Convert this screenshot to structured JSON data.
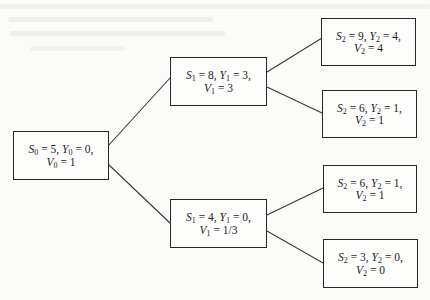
{
  "diagram": {
    "type": "binomial-tree",
    "colors": {
      "border": "#262626",
      "edge": "#3a3a3a",
      "text": "#1c1c1c",
      "background": "#fbfbfa"
    },
    "nodes": [
      {
        "id": "root",
        "level": 0,
        "S": "5",
        "Y": "0",
        "V": "1",
        "line1": {
          "s_sub": "0",
          "s_val": "5",
          "y_sub": "0",
          "y_val": "0"
        },
        "line2": {
          "v_sub": "0",
          "v_val": "1"
        }
      },
      {
        "id": "up",
        "level": 1,
        "S": "8",
        "Y": "3",
        "V": "3",
        "line1": {
          "s_sub": "1",
          "s_val": "8",
          "y_sub": "1",
          "y_val": "3"
        },
        "line2": {
          "v_sub": "1",
          "v_val": "3"
        }
      },
      {
        "id": "down",
        "level": 1,
        "S": "4",
        "Y": "0",
        "V": "1/3",
        "line1": {
          "s_sub": "1",
          "s_val": "4",
          "y_sub": "1",
          "y_val": "0"
        },
        "line2": {
          "v_sub": "1",
          "v_val": "1/3"
        }
      },
      {
        "id": "upup",
        "level": 2,
        "S": "9",
        "Y": "4",
        "V": "4",
        "line1": {
          "s_sub": "2",
          "s_val": "9",
          "y_sub": "2",
          "y_val": "4"
        },
        "line2": {
          "v_sub": "2",
          "v_val": "4"
        }
      },
      {
        "id": "updown",
        "level": 2,
        "S": "6",
        "Y": "1",
        "V": "1",
        "line1": {
          "s_sub": "2",
          "s_val": "6",
          "y_sub": "2",
          "y_val": "1"
        },
        "line2": {
          "v_sub": "2",
          "v_val": "1"
        }
      },
      {
        "id": "downup",
        "level": 2,
        "S": "6",
        "Y": "1",
        "V": "1",
        "line1": {
          "s_sub": "2",
          "s_val": "6",
          "y_sub": "2",
          "y_val": "1"
        },
        "line2": {
          "v_sub": "2",
          "v_val": "1"
        }
      },
      {
        "id": "downdown",
        "level": 2,
        "S": "3",
        "Y": "0",
        "V": "0",
        "line1": {
          "s_sub": "2",
          "s_val": "3",
          "y_sub": "2",
          "y_val": "0"
        },
        "line2": {
          "v_sub": "2",
          "v_val": "0"
        }
      }
    ],
    "edges": [
      [
        "root",
        "up"
      ],
      [
        "root",
        "down"
      ],
      [
        "up",
        "upup"
      ],
      [
        "up",
        "updown"
      ],
      [
        "down",
        "downup"
      ],
      [
        "down",
        "downdown"
      ]
    ],
    "symbols": {
      "S": "S",
      "Y": "Y",
      "V": "V",
      "eq": " = ",
      "sep": ", ",
      "trail": ","
    }
  }
}
